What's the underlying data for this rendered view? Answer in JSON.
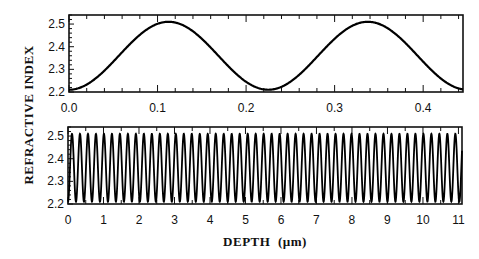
{
  "chart_data": [
    {
      "type": "line",
      "panel": "top",
      "title": "",
      "xlabel": "",
      "ylabel": "REFRACTIVE INDEX",
      "xlim": [
        0.0,
        0.445
      ],
      "ylim": [
        2.2,
        2.54
      ],
      "x_ticks": [
        "0.0",
        "0.1",
        "0.2",
        "0.3",
        "0.4"
      ],
      "y_ticks": [
        "2.2",
        "2.3",
        "2.4",
        "2.5"
      ],
      "grid": false,
      "series": [
        {
          "name": "refractive index",
          "function": "sinusoid",
          "min": 2.21,
          "max": 2.51,
          "period_um": 0.225,
          "first_min_x": 0.0,
          "peaks_x": [
            0.112,
            0.337
          ],
          "troughs_x": [
            0.0,
            0.225,
            0.445
          ]
        }
      ]
    },
    {
      "type": "line",
      "panel": "bottom",
      "title": "",
      "xlabel": "DEPTH  (µm)",
      "ylabel": "REFRACTIVE INDEX",
      "xlim": [
        0,
        11.1
      ],
      "ylim": [
        2.2,
        2.54
      ],
      "x_ticks": [
        "0",
        "1",
        "2",
        "3",
        "4",
        "5",
        "6",
        "7",
        "8",
        "9",
        "10",
        "11"
      ],
      "y_ticks": [
        "2.2",
        "2.3",
        "2.4",
        "2.5"
      ],
      "grid": false,
      "series": [
        {
          "name": "refractive index",
          "function": "sinusoid",
          "min": 2.21,
          "max": 2.51,
          "period_um": 0.225,
          "cycles_shown": 49
        }
      ]
    }
  ],
  "labels": {
    "ylabel": "REFRACTIVE INDEX",
    "xlabel": "DEPTH  (µm)"
  }
}
